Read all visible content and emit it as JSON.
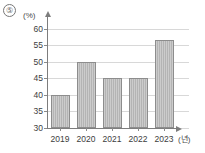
{
  "marker": {
    "label": "⑤"
  },
  "chart_data": {
    "type": "bar",
    "title": "",
    "xlabel": "(년)",
    "ylabel": "(%)",
    "categories": [
      "2019",
      "2020",
      "2021",
      "2022",
      "2023"
    ],
    "values": [
      40,
      50,
      45,
      45,
      56.5
    ],
    "series": [
      {
        "name": "",
        "values": [
          40,
          50,
          45,
          45,
          56.5
        ]
      }
    ],
    "ylim": [
      30,
      62
    ],
    "yticks": [
      30,
      35,
      40,
      45,
      50,
      55,
      60
    ],
    "ytick_labels": [
      "30",
      "35",
      "40",
      "45",
      "50",
      "55",
      "60"
    ],
    "grid": true,
    "legend": false,
    "bar_color": "#b4b4b4",
    "bar_border_color": "#8d8d8d",
    "gridline_color": "#d8d8d8",
    "axis_color": "#7d7d7d"
  }
}
